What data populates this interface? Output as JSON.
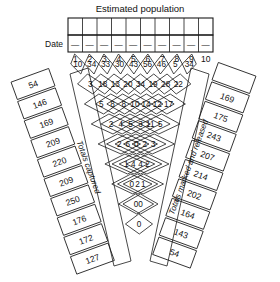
{
  "header": {
    "title": "Estimated population",
    "date_label": "Date",
    "estimated_population_row": [
      "",
      "",
      "",
      "",
      "",
      "",
      "",
      "",
      "",
      ""
    ],
    "date_dashes": [
      "—",
      "—",
      "—",
      "—",
      "—",
      "—",
      "—",
      "—",
      "—",
      "—"
    ],
    "date_numbers": [
      "1",
      "2",
      "3",
      "4",
      "5",
      "6",
      "7",
      "8",
      "9",
      "10"
    ]
  },
  "bands": {
    "left_label": "Totals captured",
    "right_label": "Totals marked and released"
  },
  "left_column": {
    "name": "totals-captured",
    "values": [
      "54",
      "146",
      "169",
      "209",
      "220",
      "209",
      "250",
      "176",
      "172",
      "127"
    ]
  },
  "right_column": {
    "name": "totals-marked-and-released",
    "values": [
      "169",
      "175",
      "243",
      "207",
      "214",
      "202",
      "164",
      "143",
      "54"
    ],
    "blank_top": ""
  },
  "chart_data": {
    "type": "table",
    "title": "Estimated population",
    "xlabel": "Date",
    "ylabel": "",
    "categories": [
      "1",
      "2",
      "3",
      "4",
      "5",
      "6",
      "7",
      "8",
      "9",
      "10"
    ],
    "row_labels": [
      "row1",
      "row2",
      "row3",
      "row4",
      "row5",
      "row6",
      "row7",
      "row8",
      "row9"
    ],
    "lattice_rows": [
      [
        "10",
        "34",
        "33",
        "30",
        "43",
        "56",
        "46",
        "5",
        "34"
      ],
      [
        "3",
        "18",
        "13",
        "20",
        "34",
        "19",
        "28",
        "22"
      ],
      [
        "5",
        "8",
        "8",
        "10",
        "14",
        "12",
        "17"
      ],
      [
        "2",
        "4",
        "5",
        "3",
        "11",
        "5"
      ],
      [
        "2",
        "6",
        "0",
        "2",
        "3"
      ],
      [
        "1",
        "4",
        "4",
        "2"
      ],
      [
        "0",
        "2",
        "1"
      ],
      [
        "0",
        "0"
      ],
      [
        "0"
      ]
    ],
    "totals_captured": [
      54,
      146,
      169,
      209,
      220,
      209,
      250,
      176,
      172,
      127
    ],
    "totals_marked_and_released": [
      169,
      175,
      243,
      207,
      214,
      202,
      164,
      143,
      54
    ],
    "grid": true,
    "legend": "none"
  },
  "colors": {
    "ink": "#1a1a1a",
    "paper": "#ffffff"
  }
}
